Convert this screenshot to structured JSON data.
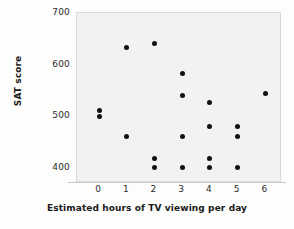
{
  "chart_data": {
    "type": "scatter",
    "title": "",
    "xlabel": "Estimated hours of TV viewing per day",
    "ylabel": "SAT score",
    "xlim": [
      -0.8,
      6.6
    ],
    "ylim": [
      370,
      700
    ],
    "xticks": [
      0,
      1,
      2,
      3,
      4,
      5,
      6
    ],
    "xticklabels": [
      "0",
      "1",
      "2",
      "3",
      "4",
      "5",
      "6"
    ],
    "yticks": [
      400,
      500,
      600,
      700
    ],
    "yticklabels": [
      "400",
      "500",
      "600",
      "700"
    ],
    "grid": false,
    "legend": null,
    "marker_color": "#111111",
    "plot_background": "#f2f2f1",
    "points": [
      {
        "x": 0,
        "y": 511
      },
      {
        "x": 0,
        "y": 499
      },
      {
        "x": 1,
        "y": 634
      },
      {
        "x": 1,
        "y": 461
      },
      {
        "x": 2,
        "y": 641
      },
      {
        "x": 2,
        "y": 418
      },
      {
        "x": 2,
        "y": 401
      },
      {
        "x": 3,
        "y": 582
      },
      {
        "x": 3,
        "y": 540
      },
      {
        "x": 3,
        "y": 461
      },
      {
        "x": 3,
        "y": 401
      },
      {
        "x": 4,
        "y": 526
      },
      {
        "x": 4,
        "y": 479
      },
      {
        "x": 4,
        "y": 417
      },
      {
        "x": 4,
        "y": 400
      },
      {
        "x": 5,
        "y": 479
      },
      {
        "x": 5,
        "y": 460
      },
      {
        "x": 5,
        "y": 400
      },
      {
        "x": 6,
        "y": 543
      }
    ]
  }
}
